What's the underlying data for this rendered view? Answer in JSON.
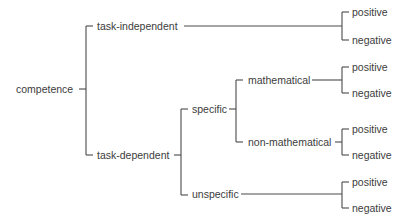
{
  "diagram": {
    "type": "tree",
    "orientation": "left-to-right",
    "root": {
      "label": "competence",
      "children": [
        {
          "label": "task-independent",
          "children": [
            {
              "label": "positive"
            },
            {
              "label": "negative"
            }
          ]
        },
        {
          "label": "task-dependent",
          "children": [
            {
              "label": "specific",
              "children": [
                {
                  "label": "mathematical",
                  "children": [
                    {
                      "label": "positive"
                    },
                    {
                      "label": "negative"
                    }
                  ]
                },
                {
                  "label": "non-mathematical",
                  "children": [
                    {
                      "label": "positive"
                    },
                    {
                      "label": "negative"
                    }
                  ]
                }
              ]
            },
            {
              "label": "unspecific",
              "children": [
                {
                  "label": "positive"
                },
                {
                  "label": "negative"
                }
              ]
            }
          ]
        }
      ]
    }
  },
  "labels": {
    "root": "competence",
    "task_independent": "task-independent",
    "task_dependent": "task-dependent",
    "specific": "specific",
    "unspecific": "unspecific",
    "mathematical": "mathematical",
    "non_mathematical": "non-mathematical",
    "leaves": {
      "ti_pos": "positive",
      "ti_neg": "negative",
      "math_pos": "positive",
      "math_neg": "negative",
      "nonmath_pos": "positive",
      "nonmath_neg": "negative",
      "unspec_pos": "positive",
      "unspec_neg": "negative"
    }
  },
  "colors": {
    "line": "#4a4a4a",
    "text": "#3c3c3c",
    "background": "#ffffff"
  }
}
